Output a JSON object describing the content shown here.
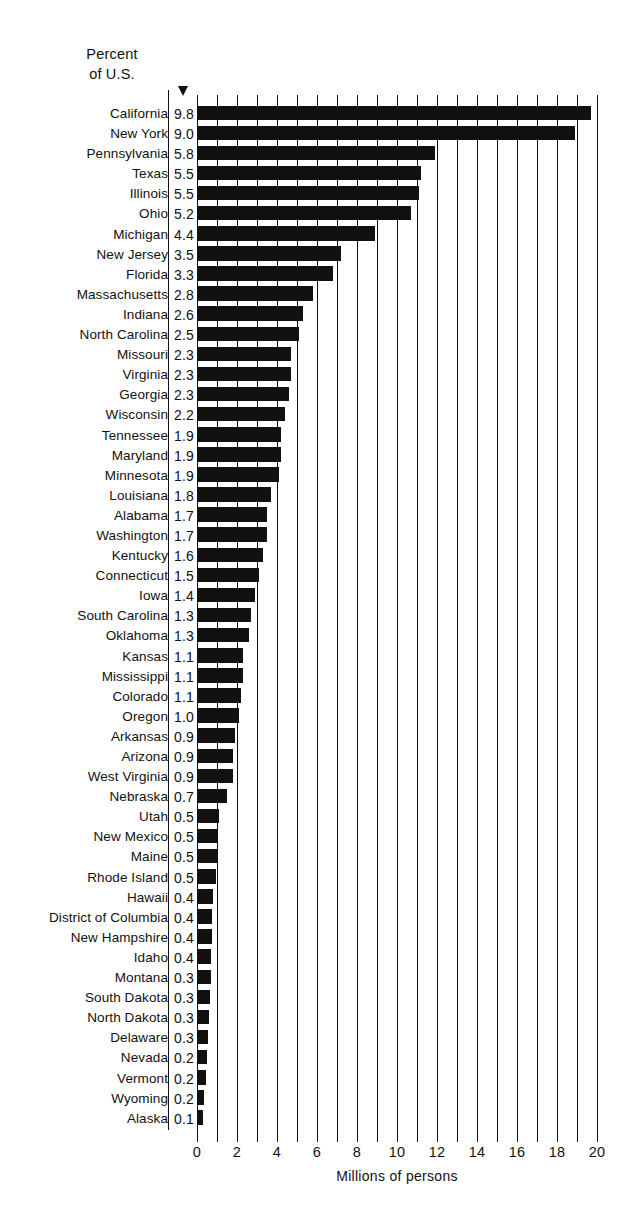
{
  "header": {
    "percent_label_line1": "Percent",
    "percent_label_line2": "of U.S."
  },
  "axis": {
    "title": "Millions of persons",
    "ticks": [
      "0",
      "2",
      "4",
      "6",
      "8",
      "10",
      "12",
      "14",
      "16",
      "18",
      "20"
    ]
  },
  "chart_data": {
    "type": "bar",
    "orientation": "horizontal",
    "title": "",
    "subtitle": "",
    "xlabel": "Millions of persons",
    "ylabel": "",
    "xlim": [
      0,
      20
    ],
    "xticks": [
      0,
      2,
      4,
      6,
      8,
      10,
      12,
      14,
      16,
      18,
      20
    ],
    "minor_tick_interval": 1,
    "grid": true,
    "grid_axis": "x",
    "legend": null,
    "bar_color": "#111111",
    "annotation_column": {
      "header": "Percent of U.S.",
      "unit": "%"
    },
    "categories": [
      "California",
      "New York",
      "Pennsylvania",
      "Texas",
      "Illinois",
      "Ohio",
      "Michigan",
      "New Jersey",
      "Florida",
      "Massachusetts",
      "Indiana",
      "North Carolina",
      "Missouri",
      "Virginia",
      "Georgia",
      "Wisconsin",
      "Tennessee",
      "Maryland",
      "Minnesota",
      "Louisiana",
      "Alabama",
      "Washington",
      "Kentucky",
      "Connecticut",
      "Iowa",
      "South Carolina",
      "Oklahoma",
      "Kansas",
      "Mississippi",
      "Colorado",
      "Oregon",
      "Arkansas",
      "Arizona",
      "West Virginia",
      "Nebraska",
      "Utah",
      "New Mexico",
      "Maine",
      "Rhode Island",
      "Hawaii",
      "District of Columbia",
      "New Hampshire",
      "Idaho",
      "Montana",
      "South Dakota",
      "North Dakota",
      "Delaware",
      "Nevada",
      "Vermont",
      "Wyoming",
      "Alaska"
    ],
    "series": [
      {
        "name": "Percent of U.S.",
        "unit": "%",
        "values": [
          9.8,
          9.0,
          5.8,
          5.5,
          5.5,
          5.2,
          4.4,
          3.5,
          3.3,
          2.8,
          2.6,
          2.5,
          2.3,
          2.3,
          2.3,
          2.2,
          1.9,
          1.9,
          1.9,
          1.8,
          1.7,
          1.7,
          1.6,
          1.5,
          1.4,
          1.3,
          1.3,
          1.1,
          1.1,
          1.1,
          1.0,
          0.9,
          0.9,
          0.9,
          0.7,
          0.5,
          0.5,
          0.5,
          0.5,
          0.4,
          0.4,
          0.4,
          0.4,
          0.3,
          0.3,
          0.3,
          0.3,
          0.2,
          0.2,
          0.2,
          0.1
        ]
      },
      {
        "name": "Population",
        "unit": "millions of persons",
        "values": [
          19.7,
          18.9,
          11.9,
          11.2,
          11.1,
          10.7,
          8.9,
          7.2,
          6.8,
          5.8,
          5.3,
          5.1,
          4.7,
          4.7,
          4.6,
          4.4,
          4.2,
          4.2,
          4.1,
          3.7,
          3.5,
          3.5,
          3.3,
          3.1,
          2.9,
          2.7,
          2.6,
          2.3,
          2.3,
          2.2,
          2.1,
          1.9,
          1.8,
          1.8,
          1.5,
          1.1,
          1.0,
          1.0,
          0.95,
          0.8,
          0.75,
          0.74,
          0.72,
          0.7,
          0.67,
          0.62,
          0.55,
          0.49,
          0.45,
          0.33,
          0.3
        ]
      }
    ]
  }
}
